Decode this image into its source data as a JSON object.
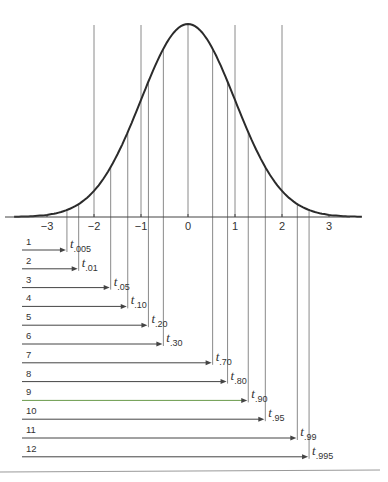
{
  "chart_data": {
    "type": "diagram",
    "title": "",
    "curve": "standard-normal-pdf",
    "x_axis": {
      "ticks": [
        -3,
        -2,
        -1,
        0,
        1,
        2,
        3
      ],
      "tick_labels": [
        "−3",
        "−2",
        "−1",
        "0",
        "1",
        "2",
        "3"
      ],
      "xlim": [
        -3.7,
        3.7
      ]
    },
    "reference_lines": [
      -2,
      -1,
      0,
      1,
      2
    ],
    "quantiles": [
      {
        "row": "1",
        "p": ".005",
        "value": -2.576
      },
      {
        "row": "2",
        "p": ".01",
        "value": -2.326
      },
      {
        "row": "3",
        "p": ".05",
        "value": -1.645
      },
      {
        "row": "4",
        "p": ".10",
        "value": -1.282
      },
      {
        "row": "5",
        "p": ".20",
        "value": -0.842
      },
      {
        "row": "6",
        "p": ".30",
        "value": -0.524
      },
      {
        "row": "7",
        "p": ".70",
        "value": 0.524
      },
      {
        "row": "8",
        "p": ".80",
        "value": 0.842
      },
      {
        "row": "9",
        "p": ".90",
        "value": 1.282
      },
      {
        "row": "10",
        "p": ".95",
        "value": 1.645
      },
      {
        "row": "11",
        "p": ".99",
        "value": 2.326
      },
      {
        "row": "12",
        "p": ".995",
        "value": 2.576
      }
    ]
  },
  "colors": {
    "curve": "#2b2b2b",
    "lines": "#8a8a8a",
    "axis": "#444444",
    "arrow": "#444444",
    "row9_arrow": "#6a9a4a",
    "divider": "#999999"
  },
  "symbol": "t"
}
